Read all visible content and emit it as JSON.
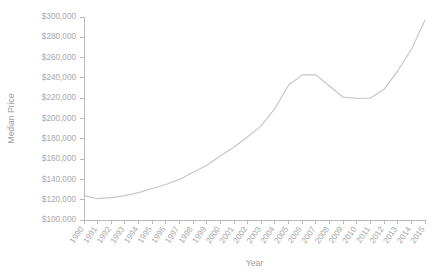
{
  "chart_data": {
    "type": "line",
    "title": "",
    "xlabel": "Year",
    "ylabel": "Median Price",
    "grid": false,
    "legend": false,
    "xlim": [
      1990,
      2015
    ],
    "ylim": [
      100000,
      300000
    ],
    "ytick_step": 20000,
    "ytick_labels": [
      "$300,000",
      "$280,000",
      "$260,000",
      "$240,000",
      "$220,000",
      "$200,000",
      "$180,000",
      "$160,000",
      "$140,000",
      "$120,000",
      "$100,000"
    ],
    "ytick_values": [
      300000,
      280000,
      260000,
      240000,
      220000,
      200000,
      180000,
      160000,
      140000,
      120000,
      100000
    ],
    "categories": [
      "1990",
      "1991",
      "1992",
      "1993",
      "1994",
      "1995",
      "1996",
      "1997",
      "1998",
      "1999",
      "2000",
      "2001",
      "2002",
      "2003",
      "2004",
      "2005",
      "2006",
      "2007",
      "2008",
      "2009",
      "2010",
      "2011",
      "2012",
      "2013",
      "2014",
      "2015"
    ],
    "x": [
      1990,
      1991,
      1992,
      1993,
      1994,
      1995,
      1996,
      1997,
      1998,
      1999,
      2000,
      2001,
      2002,
      2003,
      2004,
      2005,
      2006,
      2007,
      2008,
      2009,
      2010,
      2011,
      2012,
      2013,
      2014,
      2015
    ],
    "values": [
      124000,
      121000,
      122000,
      124000,
      127000,
      131000,
      135000,
      140000,
      147000,
      154000,
      163000,
      172000,
      182000,
      193000,
      210000,
      233000,
      243000,
      243000,
      232000,
      221000,
      220000,
      220000,
      229000,
      247000,
      268000,
      297000
    ],
    "series": [
      {
        "name": "Median Price",
        "color": "#c6c6c6",
        "values": [
          124000,
          121000,
          122000,
          124000,
          127000,
          131000,
          135000,
          140000,
          147000,
          154000,
          163000,
          172000,
          182000,
          193000,
          210000,
          233000,
          243000,
          243000,
          232000,
          221000,
          220000,
          220000,
          229000,
          247000,
          268000,
          297000
        ]
      }
    ]
  },
  "colors": {
    "line": "#c6c6c6",
    "axis": "#b9b9b9",
    "tick_text": "#a9a9a9",
    "title_text": "#9d9d9d",
    "background": "#ffffff"
  }
}
